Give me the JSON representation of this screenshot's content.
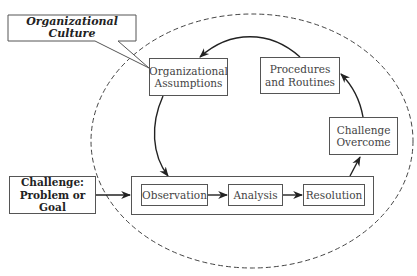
{
  "diagram": {
    "culture_label": "Organizational Culture",
    "assumptions": {
      "line1": "Organizational",
      "line2": "Assumptions"
    },
    "procedures": {
      "line1": "Procedures",
      "line2": "and Routines"
    },
    "overcome": {
      "line1": "Challenge",
      "line2": "Overcome"
    },
    "challenge": {
      "line1": "Challenge:",
      "line2": "Problem or Goal"
    },
    "process_steps": [
      "Observation",
      "Analysis",
      "Resolution"
    ]
  },
  "colors": {
    "stroke": "#333333",
    "box_border": "#555555",
    "background": "#ffffff"
  }
}
